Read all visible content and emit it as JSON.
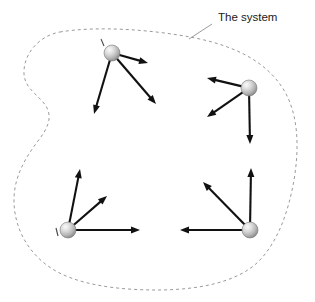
{
  "figure": {
    "title_label": "The system",
    "background_color": "#ffffff",
    "boundary": {
      "name": "system-boundary",
      "style": "dashed",
      "color": "#9a9a9a",
      "dash_pattern": "3 3",
      "stroke_width": 1,
      "closed": true
    },
    "leader_line": {
      "color": "#9a9a9a",
      "from_x": 212,
      "from_y": 24,
      "to_x": 189,
      "to_y": 39
    },
    "label_position": {
      "x": 218,
      "y": 21
    },
    "vector_color": "#111111",
    "particle_fill_light": "#f2f2f2",
    "particle_fill_mid": "#c9c9c9",
    "particle_fill_dark": "#8f8f8f",
    "particle_stroke": "#7a7a7a",
    "particle_radius": 8
  },
  "chart_data": {
    "type": "scatter",
    "title": "The system",
    "xlabel": "",
    "ylabel": "",
    "xlim": [
      0,
      315
    ],
    "ylim": [
      302,
      0
    ],
    "grid": false,
    "legend": null,
    "annotations": [
      "The system"
    ],
    "particles": [
      {
        "id": "particle-top-left",
        "x": 112,
        "y": 53,
        "tick_mark": {
          "x1": 101,
          "y1": 39,
          "x2": 104,
          "y2": 46
        },
        "vectors": [
          {
            "id": "vector-tl-right",
            "dx": 36,
            "dy": 10
          },
          {
            "id": "vector-tl-lower-right",
            "dx": 44,
            "dy": 51
          },
          {
            "id": "vector-tl-lower-left",
            "dx": -18,
            "dy": 61
          }
        ]
      },
      {
        "id": "particle-top-right",
        "x": 249,
        "y": 88,
        "tick_mark": null,
        "vectors": [
          {
            "id": "vector-tr-upper-left",
            "dx": -42,
            "dy": -10
          },
          {
            "id": "vector-tr-lower-left",
            "dx": -42,
            "dy": 29
          },
          {
            "id": "vector-tr-down",
            "dx": 1,
            "dy": 56
          }
        ]
      },
      {
        "id": "particle-bottom-left",
        "x": 68,
        "y": 230,
        "tick_mark": {
          "x1": 56,
          "y1": 228,
          "x2": 58,
          "y2": 236
        },
        "vectors": [
          {
            "id": "vector-bl-up",
            "dx": 12,
            "dy": -61
          },
          {
            "id": "vector-bl-upper-right",
            "dx": 39,
            "dy": -34
          },
          {
            "id": "vector-bl-right",
            "dx": 72,
            "dy": 0
          }
        ]
      },
      {
        "id": "particle-bottom-right",
        "x": 250,
        "y": 230,
        "tick_mark": null,
        "vectors": [
          {
            "id": "vector-br-up",
            "dx": 1,
            "dy": -62
          },
          {
            "id": "vector-br-upper-left",
            "dx": -47,
            "dy": -48
          },
          {
            "id": "vector-br-left",
            "dx": -70,
            "dy": 0
          }
        ]
      }
    ]
  }
}
